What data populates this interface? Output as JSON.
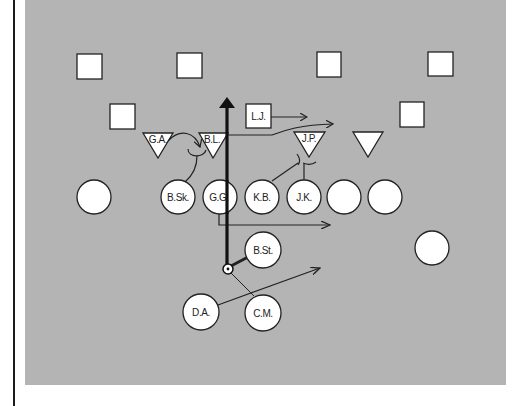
{
  "diagram": {
    "title": "",
    "colors": {
      "field": "#b4b4b4",
      "symbol_fill": "#ffffff",
      "stroke": "#222222",
      "page_rule": "#1a1a1a"
    },
    "defense": {
      "squares": [
        {
          "id": "sq1",
          "label": "",
          "x": 77,
          "y": 54
        },
        {
          "id": "sq2",
          "label": "",
          "x": 177,
          "y": 53
        },
        {
          "id": "sq3",
          "label": "",
          "x": 317,
          "y": 52
        },
        {
          "id": "sq4",
          "label": "",
          "x": 428,
          "y": 52
        },
        {
          "id": "sq5",
          "label": "",
          "x": 110,
          "y": 104
        },
        {
          "id": "sq6",
          "label": "L.J.",
          "x": 246,
          "y": 104
        },
        {
          "id": "sq7",
          "label": "",
          "x": 400,
          "y": 102
        }
      ],
      "triangles": [
        {
          "id": "tri1",
          "label": "G.A.",
          "cx": 158
        },
        {
          "id": "tri2",
          "label": "B.L.",
          "cx": 213
        },
        {
          "id": "tri3",
          "label": "J.P.",
          "cx": 309
        },
        {
          "id": "tri4",
          "label": "",
          "cx": 368
        }
      ]
    },
    "offense": {
      "circles": [
        {
          "id": "c1",
          "label": "",
          "cx": 94,
          "cy": 197
        },
        {
          "id": "c2",
          "label": "B.Sk.",
          "cx": 178,
          "cy": 197
        },
        {
          "id": "c3",
          "label": "G.G.",
          "cx": 220,
          "cy": 197
        },
        {
          "id": "c4",
          "label": "K.B.",
          "cx": 262,
          "cy": 197
        },
        {
          "id": "c5",
          "label": "J.K.",
          "cx": 304,
          "cy": 197
        },
        {
          "id": "c6",
          "label": "",
          "cx": 344,
          "cy": 197
        },
        {
          "id": "c7",
          "label": "",
          "cx": 385,
          "cy": 197
        },
        {
          "id": "c8",
          "label": "",
          "cx": 432,
          "cy": 248
        },
        {
          "id": "c9",
          "label": "B.St.",
          "cx": 263,
          "cy": 250
        },
        {
          "id": "c10",
          "label": "D.A.",
          "cx": 201,
          "cy": 312
        },
        {
          "id": "c11",
          "label": "C.M.",
          "cx": 263,
          "cy": 313
        }
      ]
    },
    "ball": {
      "label": "",
      "cx": 228,
      "cy": 269
    }
  }
}
